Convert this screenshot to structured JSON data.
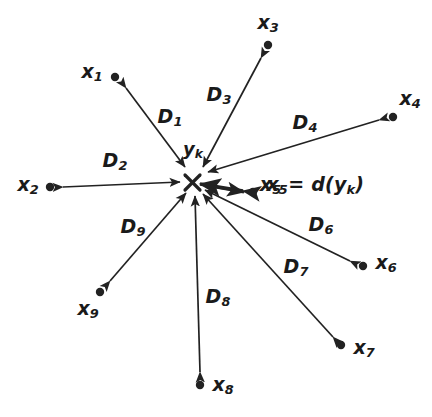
{
  "figure": {
    "background": "#ffffff",
    "stroke_color": "#222222",
    "width": 432,
    "height": 417
  },
  "center": {
    "name": "center-marker",
    "glyph": "x-cross",
    "x": 192,
    "y": 182,
    "label": "y",
    "label_sub": "k",
    "label_x": 193,
    "label_y": 150
  },
  "equation": {
    "text_main": "x",
    "text_sub": "5",
    "text_rest": " = d(y",
    "text_rest_sub": "k",
    "text_tail": ")",
    "full": "x5 = d(yk)",
    "x": 312,
    "y": 186
  },
  "points": [
    {
      "id": "x1",
      "label": "x",
      "sub": "1",
      "dot_x": 115,
      "dot_y": 77,
      "label_x": 92,
      "label_y": 73,
      "tip_x": 126,
      "tip_y": 88,
      "direction": "outward"
    },
    {
      "id": "x2",
      "label": "x",
      "sub": "2",
      "dot_x": 50,
      "dot_y": 187,
      "label_x": 28,
      "label_y": 186,
      "tip_x": 63,
      "tip_y": 187,
      "direction": "outward"
    },
    {
      "id": "x3",
      "label": "x",
      "sub": "3",
      "dot_x": 268,
      "dot_y": 45,
      "label_x": 268,
      "label_y": 24,
      "tip_x": 261,
      "tip_y": 58,
      "direction": "outward"
    },
    {
      "id": "x4",
      "label": "x",
      "sub": "4",
      "dot_x": 393,
      "dot_y": 117,
      "label_x": 410,
      "label_y": 100,
      "tip_x": 379,
      "tip_y": 120,
      "direction": "outward"
    },
    {
      "id": "x5",
      "label": "x",
      "sub": "5",
      "dot_x": 253,
      "dot_y": 192,
      "label_x": 277,
      "label_y": 186,
      "tip_x": 243,
      "tip_y": 191,
      "direction": "outward"
    },
    {
      "id": "x6",
      "label": "x",
      "sub": "6",
      "dot_x": 363,
      "dot_y": 266,
      "label_x": 386,
      "label_y": 264,
      "tip_x": 350,
      "tip_y": 261,
      "direction": "outward"
    },
    {
      "id": "x7",
      "label": "x",
      "sub": "7",
      "dot_x": 341,
      "dot_y": 345,
      "label_x": 364,
      "label_y": 349,
      "tip_x": 333,
      "tip_y": 337,
      "direction": "outward"
    },
    {
      "id": "x8",
      "label": "x",
      "sub": "8",
      "dot_x": 200,
      "dot_y": 385,
      "label_x": 223,
      "label_y": 386,
      "tip_x": 200,
      "tip_y": 372,
      "direction": "outward"
    },
    {
      "id": "x9",
      "label": "x",
      "sub": "9",
      "dot_x": 100,
      "dot_y": 292,
      "label_x": 88,
      "label_y": 310,
      "tip_x": 110,
      "tip_y": 281,
      "direction": "outward"
    }
  ],
  "vectors": [
    {
      "id": "D1",
      "label": "D",
      "sub": "1",
      "label_x": 170,
      "label_y": 118,
      "from_x": 126,
      "from_y": 88,
      "to_x": 185,
      "to_y": 167,
      "arrow_at": "both"
    },
    {
      "id": "D2",
      "label": "D",
      "sub": "2",
      "label_x": 115,
      "label_y": 162,
      "from_x": 63,
      "from_y": 187,
      "to_x": 180,
      "to_y": 182,
      "arrow_at": "both"
    },
    {
      "id": "D3",
      "label": "D",
      "sub": "3",
      "label_x": 219,
      "label_y": 96,
      "from_x": 261,
      "from_y": 58,
      "to_x": 203,
      "to_y": 167,
      "arrow_at": "both"
    },
    {
      "id": "D4",
      "label": "D",
      "sub": "4",
      "label_x": 305,
      "label_y": 124,
      "from_x": 379,
      "from_y": 120,
      "to_x": 208,
      "to_y": 172,
      "arrow_at": "both"
    },
    {
      "id": "D5",
      "label": "",
      "sub": "",
      "label_x": 0,
      "label_y": 0,
      "from_x": 243,
      "from_y": 191,
      "to_x": 200,
      "to_y": 184,
      "arrow_at": "both"
    },
    {
      "id": "D6",
      "label": "D",
      "sub": "6",
      "label_x": 321,
      "label_y": 226,
      "from_x": 350,
      "from_y": 261,
      "to_x": 205,
      "to_y": 190,
      "arrow_at": "both"
    },
    {
      "id": "D7",
      "label": "D",
      "sub": "7",
      "label_x": 296,
      "label_y": 268,
      "from_x": 333,
      "from_y": 337,
      "to_x": 203,
      "to_y": 194,
      "arrow_at": "both"
    },
    {
      "id": "D8",
      "label": "D",
      "sub": "8",
      "label_x": 218,
      "label_y": 298,
      "from_x": 200,
      "from_y": 372,
      "to_x": 195,
      "to_y": 196,
      "arrow_at": "both"
    },
    {
      "id": "D9",
      "label": "D",
      "sub": "9",
      "label_x": 133,
      "label_y": 228,
      "from_x": 110,
      "from_y": 281,
      "to_x": 186,
      "to_y": 193,
      "arrow_at": "both"
    }
  ]
}
